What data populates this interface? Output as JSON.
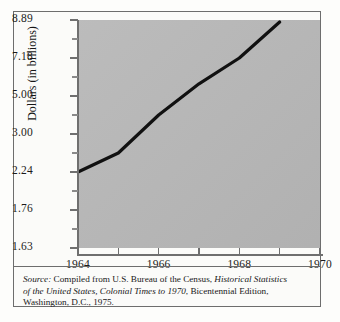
{
  "figure": {
    "plot_bg_color": "#b8b8b8",
    "frame_color": "#6d6d6d",
    "line_color": "#111111"
  },
  "chart_data": {
    "type": "line",
    "title": "",
    "xlabel": "",
    "ylabel": "Dollars (in billions)",
    "grid": false,
    "legend": false,
    "x_tick_labels": [
      "1964",
      "",
      "1966",
      "",
      "1968",
      "",
      "1970"
    ],
    "x_ticks": [
      1964,
      1965,
      1966,
      1967,
      1968,
      1969,
      1970
    ],
    "xlim": [
      1964,
      1970
    ],
    "y_tick_labels": [
      "8.89",
      "7.18",
      "5.00",
      "3.00",
      "2.24",
      "1.76",
      "1.63"
    ],
    "y_ticks": [
      8.89,
      7.18,
      5.0,
      3.0,
      2.24,
      1.76,
      1.63
    ],
    "y_scale": "nonlinear-equal-spaced",
    "x": [
      1964,
      1965,
      1966,
      1967,
      1968,
      1969
    ],
    "values": [
      2.24,
      2.62,
      4.0,
      5.7,
      7.18,
      8.8
    ]
  },
  "axis": {
    "y_labels": [
      {
        "text": "8.89",
        "value": 8.89
      },
      {
        "text": "7.18",
        "value": 7.18
      },
      {
        "text": "5.00",
        "value": 5.0
      },
      {
        "text": "3.00",
        "value": 3.0
      },
      {
        "text": "2.24",
        "value": 2.24
      },
      {
        "text": "1.76",
        "value": 1.76
      },
      {
        "text": "1.63",
        "value": 1.63
      }
    ],
    "y_title": "Dollars (in billions)",
    "x_labels": [
      {
        "text": "1964",
        "value": 1964
      },
      {
        "text": "1966",
        "value": 1966
      },
      {
        "text": "1968",
        "value": 1968
      },
      {
        "text": "1970",
        "value": 1970
      }
    ]
  },
  "source_note": {
    "label": "Source:",
    "line1_rest": " Compiled from U.S. Bureau of the Census, ",
    "line1_italic": "Historical Statistics",
    "line2_italic": "of the United States, Colonial Times to 1970",
    "line2_rest": ", Bicentennial Edition,",
    "line3": "Washington, D.C., 1975."
  }
}
